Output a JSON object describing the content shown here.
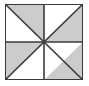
{
  "figure": {
    "canvas": {
      "width": 89,
      "height": 86,
      "background": "#ffffff"
    },
    "square": {
      "x": 5,
      "y": 4,
      "width": 78,
      "height": 76,
      "border_color": "#3a3a3a",
      "border_width": 2,
      "fill": "#ffffff"
    },
    "colors": {
      "shaded": "#cccccc",
      "unshaded": "#ffffff",
      "line": "#3a3a3a"
    },
    "geometry": {
      "viewbox": "0 0 78 76",
      "center": {
        "x": 39,
        "y": 38
      },
      "corners": {
        "top_left": {
          "x": 0,
          "y": 0
        },
        "top_right": {
          "x": 78,
          "y": 0
        },
        "bottom_right": {
          "x": 78,
          "y": 76
        },
        "bottom_left": {
          "x": 0,
          "y": 76
        }
      },
      "edge_midpoints": {
        "top": {
          "x": 39,
          "y": 0
        },
        "right": {
          "x": 78,
          "y": 38
        },
        "bottom": {
          "x": 39,
          "y": 76
        },
        "left": {
          "x": 0,
          "y": 38
        }
      }
    },
    "divisions": {
      "count": 8,
      "description": "Square divided into 8 congruent right triangles by both diagonals, the vertical midline and the horizontal midline.",
      "lines": [
        {
          "name": "diagonal-tl-br",
          "points": "0,0 78,76"
        },
        {
          "name": "diagonal-tr-bl",
          "points": "78,0 0,76"
        },
        {
          "name": "midline-vertical",
          "points": "39,0 39,76"
        },
        {
          "name": "midline-horizontal",
          "points": "0,38 78,38"
        }
      ]
    },
    "triangles": [
      {
        "id": "top-left-upper-right",
        "quadrant": "top-left",
        "position": "right of the top-left diagonal",
        "points": "0,0 39,0 39,38",
        "shaded": true
      },
      {
        "id": "top-left-lower-left",
        "quadrant": "top-left",
        "position": "left of the top-left diagonal",
        "points": "0,0 39,38 0,38",
        "shaded": false
      },
      {
        "id": "top-right-upper-right",
        "quadrant": "top-right",
        "position": "above the top-right diagonal",
        "points": "39,0 78,0 39,38",
        "shaded": false
      },
      {
        "id": "top-right-lower-right",
        "quadrant": "top-right",
        "position": "below the top-right diagonal",
        "points": "78,0 78,38 39,38",
        "shaded": true
      },
      {
        "id": "bottom-left-upper-left",
        "quadrant": "bottom-left",
        "position": "above the bottom-left diagonal",
        "points": "0,38 39,38 0,76",
        "shaded": true
      },
      {
        "id": "bottom-left-lower-right",
        "quadrant": "bottom-left",
        "position": "below the bottom-left diagonal",
        "points": "0,76 39,38 39,76",
        "shaded": false
      },
      {
        "id": "bottom-right-upper-left",
        "quadrant": "bottom-right",
        "position": "above the bottom-right diagonal",
        "points": "39,38 78,38 39,76",
        "shaded": false
      },
      {
        "id": "bottom-right-lower-right",
        "quadrant": "bottom-right",
        "position": "below the bottom-right diagonal",
        "points": "78,38 78,76 39,76",
        "shaded": true
      }
    ],
    "shaded_count": 4,
    "unshaded_count": 4,
    "pattern": "pinwheel"
  }
}
